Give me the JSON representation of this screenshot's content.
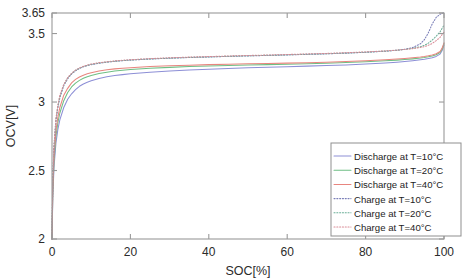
{
  "chart_data": {
    "type": "line",
    "title": "",
    "xlabel": "SOC[%]",
    "ylabel": "OCV[V]",
    "xlim": [
      0,
      100
    ],
    "ylim": [
      2,
      3.65
    ],
    "xticks": [
      0,
      20,
      40,
      60,
      80,
      100
    ],
    "xtick_labels": [
      "0",
      "20",
      "40",
      "60",
      "80",
      "100"
    ],
    "yticks": [
      2,
      2.5,
      3,
      3.5,
      3.65
    ],
    "ytick_labels": [
      "2",
      "2.5",
      "3",
      "3.5",
      "3.65"
    ],
    "grid": false,
    "legend_position": "lower right",
    "x": [
      0,
      0.2,
      0.5,
      1,
      1.5,
      2,
      3,
      4,
      5,
      6,
      7,
      8,
      9,
      10,
      12,
      14,
      16,
      18,
      20,
      25,
      30,
      35,
      40,
      45,
      50,
      55,
      60,
      65,
      70,
      75,
      80,
      85,
      88,
      90,
      92,
      94,
      95,
      96,
      97,
      98,
      99,
      99.5,
      100
    ],
    "series": [
      {
        "name": "Discharge at T=10°C",
        "label": "Discharge at T=10°C",
        "color": "#8d8fd6",
        "style": "solid",
        "values": [
          2.0,
          2.3,
          2.52,
          2.7,
          2.8,
          2.87,
          2.96,
          3.02,
          3.06,
          3.09,
          3.115,
          3.132,
          3.145,
          3.156,
          3.172,
          3.184,
          3.193,
          3.2,
          3.206,
          3.218,
          3.227,
          3.234,
          3.24,
          3.245,
          3.25,
          3.254,
          3.258,
          3.262,
          3.266,
          3.271,
          3.277,
          3.285,
          3.291,
          3.296,
          3.302,
          3.309,
          3.313,
          3.318,
          3.324,
          3.333,
          3.35,
          3.374,
          3.415
        ]
      },
      {
        "name": "Discharge at T=20°C",
        "label": "Discharge at T=20°C",
        "color": "#6fbf85",
        "style": "solid",
        "values": [
          2.0,
          2.33,
          2.56,
          2.75,
          2.85,
          2.92,
          3.01,
          3.07,
          3.11,
          3.138,
          3.158,
          3.173,
          3.185,
          3.194,
          3.208,
          3.218,
          3.226,
          3.232,
          3.237,
          3.246,
          3.253,
          3.259,
          3.263,
          3.267,
          3.27,
          3.273,
          3.276,
          3.279,
          3.283,
          3.288,
          3.294,
          3.301,
          3.306,
          3.31,
          3.315,
          3.321,
          3.325,
          3.33,
          3.336,
          3.345,
          3.362,
          3.385,
          3.425
        ]
      },
      {
        "name": "Discharge at T=40°C",
        "label": "Discharge at T=40°C",
        "color": "#e8857f",
        "style": "solid",
        "values": [
          2.0,
          2.36,
          2.6,
          2.79,
          2.89,
          2.96,
          3.05,
          3.1,
          3.14,
          3.165,
          3.183,
          3.196,
          3.206,
          3.214,
          3.226,
          3.235,
          3.242,
          3.247,
          3.251,
          3.259,
          3.265,
          3.269,
          3.273,
          3.276,
          3.279,
          3.281,
          3.284,
          3.287,
          3.291,
          3.296,
          3.302,
          3.309,
          3.314,
          3.318,
          3.323,
          3.329,
          3.333,
          3.338,
          3.344,
          3.353,
          3.369,
          3.392,
          3.432
        ]
      },
      {
        "name": "Charge at T=10°C",
        "label": "Charge at T=10°C",
        "color": "#7b7fb8",
        "style": "dotted",
        "values": [
          2.0,
          2.42,
          2.66,
          2.86,
          2.96,
          3.03,
          3.12,
          3.17,
          3.205,
          3.228,
          3.245,
          3.257,
          3.266,
          3.273,
          3.283,
          3.291,
          3.297,
          3.302,
          3.306,
          3.314,
          3.32,
          3.325,
          3.329,
          3.333,
          3.337,
          3.34,
          3.344,
          3.348,
          3.352,
          3.357,
          3.363,
          3.371,
          3.378,
          3.385,
          3.398,
          3.425,
          3.455,
          3.505,
          3.57,
          3.618,
          3.64,
          3.648,
          3.65
        ]
      },
      {
        "name": "Charge at T=20°C",
        "label": "Charge at T=20°C",
        "color": "#6aae97",
        "style": "dotted",
        "values": [
          2.0,
          2.43,
          2.67,
          2.87,
          2.97,
          3.04,
          3.125,
          3.175,
          3.208,
          3.231,
          3.247,
          3.259,
          3.268,
          3.275,
          3.285,
          3.292,
          3.298,
          3.303,
          3.307,
          3.315,
          3.321,
          3.326,
          3.33,
          3.334,
          3.338,
          3.341,
          3.345,
          3.349,
          3.353,
          3.358,
          3.364,
          3.372,
          3.378,
          3.384,
          3.392,
          3.404,
          3.414,
          3.43,
          3.452,
          3.48,
          3.512,
          3.538,
          3.56
        ]
      },
      {
        "name": "Charge at T=40°C",
        "label": "Charge at T=40°C",
        "color": "#d98b96",
        "style": "dotted",
        "values": [
          2.0,
          2.44,
          2.68,
          2.88,
          2.98,
          3.05,
          3.128,
          3.178,
          3.21,
          3.233,
          3.249,
          3.261,
          3.27,
          3.277,
          3.287,
          3.294,
          3.3,
          3.305,
          3.309,
          3.317,
          3.323,
          3.328,
          3.332,
          3.336,
          3.34,
          3.343,
          3.347,
          3.351,
          3.355,
          3.36,
          3.366,
          3.373,
          3.379,
          3.384,
          3.39,
          3.399,
          3.405,
          3.414,
          3.428,
          3.448,
          3.472,
          3.492,
          3.51
        ]
      }
    ]
  },
  "legend": {
    "items": [
      {
        "label": "Discharge at T=10°C",
        "color": "#8d8fd6",
        "style": "solid"
      },
      {
        "label": "Discharge at T=20°C",
        "color": "#6fbf85",
        "style": "solid"
      },
      {
        "label": "Discharge at T=40°C",
        "color": "#e8857f",
        "style": "solid"
      },
      {
        "label": "Charge at T=10°C",
        "color": "#7b7fb8",
        "style": "dotted"
      },
      {
        "label": "Charge at T=20°C",
        "color": "#6aae97",
        "style": "dotted"
      },
      {
        "label": "Charge at T=40°C",
        "color": "#d98b96",
        "style": "dotted"
      }
    ]
  },
  "axes": {
    "x_title": "SOC[%]",
    "y_title": "OCV[V]"
  }
}
